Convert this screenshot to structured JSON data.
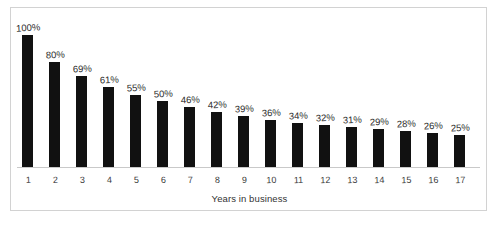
{
  "chart_data": {
    "type": "bar",
    "title": "",
    "subtitle": "",
    "xlabel": "Years in business",
    "ylabel": "",
    "categories": [
      "1",
      "2",
      "3",
      "4",
      "5",
      "6",
      "7",
      "8",
      "9",
      "10",
      "11",
      "12",
      "13",
      "14",
      "15",
      "16",
      "17"
    ],
    "values": [
      100,
      80,
      69,
      61,
      55,
      50,
      46,
      42,
      39,
      36,
      34,
      32,
      31,
      29,
      28,
      26,
      25
    ],
    "data_labels": [
      "100%",
      "80%",
      "69%",
      "61%",
      "55%",
      "50%",
      "46%",
      "42%",
      "39%",
      "36%",
      "34%",
      "32%",
      "31%",
      "29%",
      "28%",
      "26%",
      "25%"
    ],
    "value_unit": "%",
    "ylim": [
      0,
      100
    ],
    "grid": false,
    "legend": false,
    "legend_position": "none",
    "bar_color": "#111111",
    "label_color": "#2b2b2b",
    "axis_color": "#c9c9c9",
    "plot_background": "#ffffff",
    "frame_color": "#d2d2d2",
    "annotations": []
  }
}
